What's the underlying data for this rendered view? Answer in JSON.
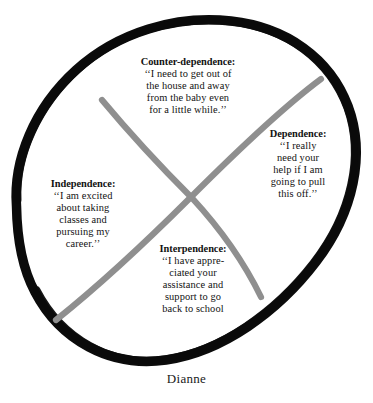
{
  "figure": {
    "caption": "Dianne",
    "colors": {
      "ellipse": "#0b0b0b",
      "curve": "#8f8f8f",
      "text": "#121212",
      "background": "#ffffff"
    },
    "quadrants": [
      {
        "id": "counter-dependence",
        "heading": "Counter-dependence:",
        "lines": [
          "‘‘I need to get out of",
          "the house and away",
          "from the baby even",
          "for a little while.’’"
        ]
      },
      {
        "id": "dependence",
        "heading": "Dependence:",
        "lines": [
          "‘‘I really",
          "need your",
          "help if I am",
          "going to pull",
          "this off.’’"
        ]
      },
      {
        "id": "independence",
        "heading": "Independence:",
        "lines": [
          "‘‘I am excited",
          "about taking",
          "classes and",
          "pursuing my",
          "career.’’"
        ]
      },
      {
        "id": "interpendence",
        "heading": "Interpendence:",
        "lines": [
          "‘‘I have appre-",
          "ciated your",
          "assistance and",
          "support to go",
          "back to school"
        ]
      }
    ]
  }
}
